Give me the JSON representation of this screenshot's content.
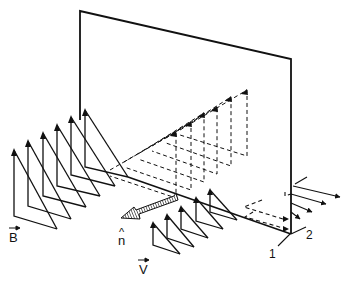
{
  "labels": {
    "B": "B",
    "n": "n",
    "n_hat": "^",
    "V": "V",
    "axis1": "1",
    "axis2": "2"
  },
  "colors": {
    "ink": "#111111",
    "background": "#ffffff"
  }
}
